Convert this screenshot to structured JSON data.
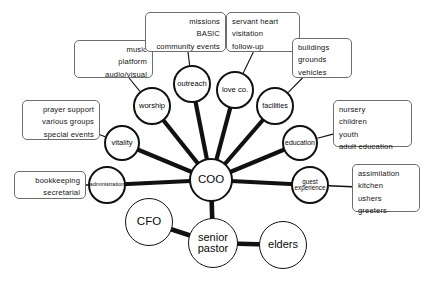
{
  "diagram": {
    "colors": {
      "background": "#ffffff",
      "node_stroke": "#111111",
      "edge_stroke": "#111111",
      "box_stroke": "#6d6d6d",
      "text": "#0a0a0a"
    },
    "nodes": [
      {
        "id": "coo",
        "label": "COO",
        "cx": 211,
        "cy": 180,
        "r": 22,
        "font_size": 11.5,
        "weight": "thick"
      },
      {
        "id": "senior-pastor",
        "label": "senior\npastor",
        "cx": 213,
        "cy": 243,
        "r": 25,
        "font_size": 11,
        "weight": "thin"
      },
      {
        "id": "cfo",
        "label": "CFO",
        "cx": 149,
        "cy": 222,
        "r": 24,
        "font_size": 11.5,
        "weight": "thin"
      },
      {
        "id": "elders",
        "label": "elders",
        "cx": 283,
        "cy": 245,
        "r": 24,
        "font_size": 11,
        "weight": "thin"
      },
      {
        "id": "worship",
        "label": "worship",
        "cx": 152,
        "cy": 106,
        "r": 19,
        "font_size": 7.6,
        "weight": "thick"
      },
      {
        "id": "outreach",
        "label": "outreach",
        "cx": 192,
        "cy": 84,
        "r": 19,
        "font_size": 7.6,
        "weight": "thick"
      },
      {
        "id": "love-co",
        "label": "love co.",
        "cx": 235,
        "cy": 90,
        "r": 19,
        "font_size": 7.6,
        "weight": "thick"
      },
      {
        "id": "facilities",
        "label": "facilities",
        "cx": 275,
        "cy": 106,
        "r": 19,
        "font_size": 7.2,
        "weight": "thick"
      },
      {
        "id": "education",
        "label": "education",
        "cx": 300,
        "cy": 143,
        "r": 18,
        "font_size": 6.9,
        "weight": "thick"
      },
      {
        "id": "guest-experience",
        "label": "guest\nexperience",
        "cx": 310,
        "cy": 185,
        "r": 19,
        "font_size": 6.3,
        "weight": "thick"
      },
      {
        "id": "vitality",
        "label": "vitality",
        "cx": 122,
        "cy": 143,
        "r": 18,
        "font_size": 7.6,
        "weight": "thick"
      },
      {
        "id": "administration",
        "label": "administration",
        "cx": 107,
        "cy": 185,
        "r": 19,
        "font_size": 5.6,
        "weight": "thick"
      }
    ],
    "edges": [
      {
        "from": "coo",
        "to": "worship",
        "width": 4.2
      },
      {
        "from": "coo",
        "to": "outreach",
        "width": 4.2
      },
      {
        "from": "coo",
        "to": "love-co",
        "width": 4.2
      },
      {
        "from": "coo",
        "to": "facilities",
        "width": 4.2
      },
      {
        "from": "coo",
        "to": "education",
        "width": 4.2
      },
      {
        "from": "coo",
        "to": "guest-experience",
        "width": 4.2
      },
      {
        "from": "coo",
        "to": "vitality",
        "width": 4.2
      },
      {
        "from": "coo",
        "to": "administration",
        "width": 4.2
      },
      {
        "from": "coo",
        "to": "senior-pastor",
        "width": 4.6
      },
      {
        "from": "senior-pastor",
        "to": "cfo",
        "width": 4.6
      },
      {
        "from": "senior-pastor",
        "to": "elders",
        "width": 4.6
      }
    ],
    "connectors": [
      {
        "id": "worship-music",
        "from": "worship",
        "to_box": "music",
        "width": 1.1
      },
      {
        "id": "outreach-missions",
        "from": "outreach",
        "to_box": "missions",
        "width": 1.1
      },
      {
        "id": "love-co-servant",
        "from": "love-co",
        "to_box": "servant",
        "width": 1.1
      },
      {
        "id": "facilities-buildings",
        "from": "facilities",
        "to_box": "buildings",
        "width": 1.1
      },
      {
        "id": "education-nursery",
        "from": "education",
        "to_box": "nursery",
        "width": 1.1
      },
      {
        "id": "guest-assimilation",
        "from": "guest-experience",
        "to_box": "assimilation",
        "width": 1.5
      },
      {
        "id": "vitality-prayer",
        "from": "vitality",
        "to_box": "prayer",
        "width": 1.1
      },
      {
        "id": "administration-books",
        "from": "administration",
        "to_box": "bookkeeping",
        "width": 1.5
      }
    ],
    "boxes": [
      {
        "id": "music",
        "align": "align-right",
        "x": 74,
        "y": 40,
        "w": 79,
        "h": 38,
        "lines": [
          "music",
          "platform",
          "audio/visual"
        ]
      },
      {
        "id": "missions",
        "align": "align-right",
        "x": 145,
        "y": 12,
        "w": 81,
        "h": 40,
        "lines": [
          "missions",
          "BASIC",
          "community events"
        ]
      },
      {
        "id": "servant",
        "align": "align-left",
        "x": 226,
        "y": 12,
        "w": 74,
        "h": 40,
        "lines": [
          "servant heart",
          "visitation",
          "follow-up"
        ]
      },
      {
        "id": "buildings",
        "align": "align-left",
        "x": 292,
        "y": 38,
        "w": 60,
        "h": 40,
        "lines": [
          "buildings",
          "grounds",
          "vehicles"
        ]
      },
      {
        "id": "nursery",
        "align": "align-left",
        "x": 333,
        "y": 100,
        "w": 79,
        "h": 47,
        "lines": [
          "nursery",
          "children",
          "youth",
          "adult education"
        ]
      },
      {
        "id": "assimilation",
        "align": "align-left",
        "x": 352,
        "y": 164,
        "w": 68,
        "h": 48,
        "lines": [
          "assimilation",
          "kitchen",
          "ushers",
          "greeters"
        ]
      },
      {
        "id": "prayer",
        "align": "align-right",
        "x": 22,
        "y": 100,
        "w": 78,
        "h": 40,
        "lines": [
          "prayer support",
          "various groups",
          "special events"
        ]
      },
      {
        "id": "bookkeeping",
        "align": "align-right",
        "x": 14,
        "y": 171,
        "w": 72,
        "h": 28,
        "lines": [
          "bookkeeping",
          "secretarial"
        ]
      }
    ]
  }
}
